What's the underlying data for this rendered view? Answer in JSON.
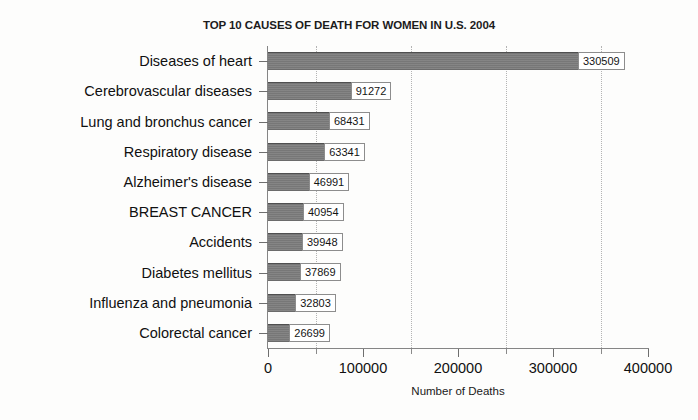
{
  "chart_data": {
    "type": "bar",
    "orientation": "horizontal",
    "title": "TOP 10 CAUSES OF DEATH FOR WOMEN IN U.S. 2004",
    "xlabel": "Number of Deaths",
    "ylabel": "",
    "xlim": [
      0,
      400000
    ],
    "ylim": null,
    "grid": true,
    "grid_axis": "x",
    "grid_style": "dotted",
    "gridline_values": [
      50000,
      150000,
      250000,
      350000
    ],
    "legend": null,
    "bar_color": "#777777",
    "value_labels_shown": true,
    "xticks": [
      0,
      100000,
      200000,
      300000,
      400000
    ],
    "xtick_labels": [
      "0",
      "100000",
      "200000",
      "300000",
      "400000"
    ],
    "xticks_minor": [
      50000,
      150000,
      250000,
      350000
    ],
    "categories": [
      "Diseases of heart",
      "Cerebrovascular diseases",
      "Lung and bronchus cancer",
      "Respiratory disease",
      "Alzheimer's disease",
      "BREAST CANCER",
      "Accidents",
      "Diabetes mellitus",
      "Influenza and pneumonia",
      "Colorectal cancer"
    ],
    "values": [
      330509,
      91272,
      68431,
      63341,
      46991,
      40954,
      39948,
      37869,
      32803,
      26699
    ],
    "value_label_texts": [
      "330509",
      "91272",
      "68431",
      "63341",
      "46991",
      "40954",
      "39948",
      "37869",
      "32803",
      "26699"
    ]
  }
}
